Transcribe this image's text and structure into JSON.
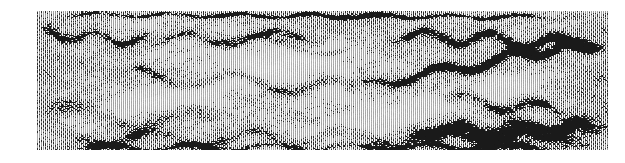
{
  "figure": {
    "kind": "seismic-reflection-profile",
    "background_color": "#ffffff",
    "ink_color": "#1a1a1a",
    "paper_color": "#fdfdfd",
    "width_px": 625,
    "height_px": 163
  },
  "panel": {
    "left_px": 37,
    "top_px": 11,
    "width_px": 571,
    "height_px": 139,
    "trace_count": 286,
    "trace_spacing_px": 2.0,
    "sample_rows": 139,
    "wiggle_amplitude_px": 1.9,
    "fill_side": "positive",
    "gain": 1.0
  },
  "chart_data": {
    "type": "heatmap",
    "title": "",
    "xlabel": "",
    "ylabel": "",
    "x": [
      0,
      571
    ],
    "y": [
      0,
      139
    ],
    "grid": false,
    "legend": "none",
    "colormap": "grayscale",
    "noise": {
      "seed": 20240517,
      "base_level": 0.46,
      "speckle": 0.62,
      "dither_grid_px": 2
    },
    "reflectors": [
      {
        "name": "top-rim-band",
        "x0": 0,
        "x1": 571,
        "y0": 3,
        "y1": 6,
        "thickness": 5,
        "strength": 0.92,
        "wavelength": 70,
        "wave_amp": 2
      },
      {
        "name": "upper-left-dark-lens",
        "x0": 0,
        "x1": 120,
        "y0": 22,
        "y1": 30,
        "thickness": 11,
        "strength": 0.9,
        "wavelength": 55,
        "wave_amp": 5
      },
      {
        "name": "upper-mid-band",
        "x0": 95,
        "x1": 300,
        "y0": 30,
        "y1": 24,
        "thickness": 9,
        "strength": 0.7,
        "wavelength": 90,
        "wave_amp": 6
      },
      {
        "name": "arch-crest",
        "x0": 150,
        "x1": 330,
        "y0": 26,
        "y1": 40,
        "thickness": 8,
        "strength": 0.55,
        "wavelength": 120,
        "wave_amp": 7
      },
      {
        "name": "upper-right-band",
        "x0": 330,
        "x1": 571,
        "y0": 22,
        "y1": 34,
        "thickness": 12,
        "strength": 0.82,
        "wavelength": 64,
        "wave_amp": 6
      },
      {
        "name": "mid-dipping-reflector",
        "x0": 60,
        "x1": 330,
        "y0": 62,
        "y1": 78,
        "thickness": 10,
        "strength": 0.74,
        "wavelength": 100,
        "wave_amp": 8
      },
      {
        "name": "mid-fault-limb",
        "x0": 300,
        "x1": 470,
        "y0": 78,
        "y1": 48,
        "thickness": 11,
        "strength": 0.95,
        "wavelength": 80,
        "wave_amp": 5
      },
      {
        "name": "right-steep-limb",
        "x0": 440,
        "x1": 571,
        "y0": 50,
        "y1": 30,
        "thickness": 10,
        "strength": 0.88,
        "wavelength": 60,
        "wave_amp": 5
      },
      {
        "name": "lower-right-lobe",
        "x0": 400,
        "x1": 530,
        "y0": 86,
        "y1": 100,
        "thickness": 12,
        "strength": 0.9,
        "wavelength": 70,
        "wave_amp": 6
      },
      {
        "name": "lower-left-diffuse",
        "x0": 0,
        "x1": 200,
        "y0": 100,
        "y1": 112,
        "thickness": 14,
        "strength": 0.52,
        "wavelength": 110,
        "wave_amp": 9
      },
      {
        "name": "basal-band",
        "x0": 0,
        "x1": 571,
        "y0": 128,
        "y1": 124,
        "thickness": 12,
        "strength": 0.58,
        "wavelength": 95,
        "wave_amp": 7
      },
      {
        "name": "basal-right-dark",
        "x0": 360,
        "x1": 571,
        "y0": 120,
        "y1": 116,
        "thickness": 16,
        "strength": 0.86,
        "wavelength": 58,
        "wave_amp": 5
      },
      {
        "name": "bottom-edge-band",
        "x0": 0,
        "x1": 571,
        "y0": 136,
        "y1": 136,
        "thickness": 6,
        "strength": 0.66,
        "wavelength": 80,
        "wave_amp": 3
      }
    ],
    "bright_zones": [
      {
        "name": "upper-center-quiet",
        "cx": 230,
        "cy": 50,
        "rx": 90,
        "ry": 22,
        "strength": 0.7
      },
      {
        "name": "mid-left-quiet",
        "cx": 120,
        "cy": 86,
        "rx": 80,
        "ry": 18,
        "strength": 0.62
      },
      {
        "name": "mid-center-quiet",
        "cx": 330,
        "cy": 98,
        "rx": 70,
        "ry": 20,
        "strength": 0.58
      },
      {
        "name": "right-upper-quiet",
        "cx": 470,
        "cy": 74,
        "rx": 50,
        "ry": 16,
        "strength": 0.5
      },
      {
        "name": "lower-center-quiet",
        "cx": 250,
        "cy": 120,
        "rx": 90,
        "ry": 14,
        "strength": 0.45
      }
    ],
    "shadow_zones": [
      {
        "name": "left-edge-shade",
        "cx": 10,
        "cy": 70,
        "rx": 30,
        "ry": 60,
        "strength": 0.3
      },
      {
        "name": "right-edge-shade",
        "cx": 560,
        "cy": 80,
        "rx": 40,
        "ry": 70,
        "strength": 0.34
      },
      {
        "name": "bottom-left-shade",
        "cx": 60,
        "cy": 135,
        "rx": 60,
        "ry": 18,
        "strength": 0.38
      },
      {
        "name": "bottom-right-shade",
        "cx": 500,
        "cy": 132,
        "rx": 80,
        "ry": 20,
        "strength": 0.42
      }
    ]
  }
}
